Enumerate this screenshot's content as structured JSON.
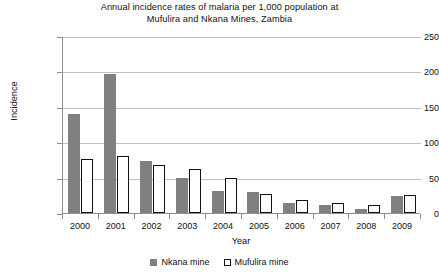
{
  "chart_data": {
    "type": "bar",
    "title": "Annual incidence rates of malaria per 1,000 population at Mufulira and Nkana Mines, Zambia",
    "title_lines": [
      "Annual incidence rates of malaria per 1,000 population at",
      "Mufulira and Nkana Mines, Zambia"
    ],
    "xlabel": "Year",
    "ylabel": "Incidence",
    "categories": [
      "2000",
      "2001",
      "2002",
      "2003",
      "2004",
      "2005",
      "2006",
      "2007",
      "2008",
      "2009"
    ],
    "series": [
      {
        "name": "Nkana mine",
        "color": "#808080",
        "values": [
          140,
          196,
          73,
          50,
          31,
          29,
          14,
          11,
          6,
          24
        ]
      },
      {
        "name": "Mufulira mine",
        "color": "#ffffff",
        "values": [
          76,
          80,
          68,
          62,
          50,
          27,
          19,
          14,
          11,
          25
        ]
      }
    ],
    "ylim": [
      0,
      250
    ],
    "yticks": [
      0,
      50,
      100,
      150,
      200,
      250
    ],
    "ytick_labels": [
      "0",
      "50",
      "100",
      "150",
      "200",
      "250"
    ],
    "grid": "horizontal",
    "legend_position": "bottom"
  }
}
